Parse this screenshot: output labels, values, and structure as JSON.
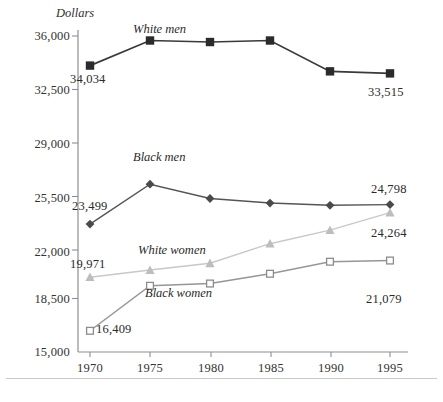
{
  "chart_data": {
    "type": "line",
    "title": "",
    "ylabel": "Dollars",
    "xlabel": "",
    "categories": [
      "1970",
      "1975",
      "1980",
      "1985",
      "1990",
      "1995"
    ],
    "x": [
      1970,
      1975,
      1980,
      1985,
      1990,
      1995
    ],
    "ylim": [
      15000,
      36000
    ],
    "yticks": [
      "15,000",
      "18,500",
      "22,000",
      "25,500",
      "29,000",
      "32,500",
      "36,000"
    ],
    "ytick_values": [
      15000,
      18500,
      22000,
      25500,
      29000,
      32500,
      36000
    ],
    "grid": false,
    "legend_position": "inline-labels",
    "series": [
      {
        "name": "White men",
        "marker": "filled-square",
        "color": "#2b2b2b",
        "line_color": "#3a3a3a",
        "values": [
          34034,
          35700,
          35600,
          35700,
          33650,
          33515
        ],
        "endpoint_labels": {
          "first": "34,034",
          "last": "33,515"
        }
      },
      {
        "name": "Black men",
        "marker": "filled-diamond",
        "color": "#4a4a4a",
        "line_color": "#555555",
        "values": [
          23499,
          26150,
          25200,
          24900,
          24750,
          24798
        ],
        "endpoint_labels": {
          "first": "23,499",
          "last": "24,798"
        }
      },
      {
        "name": "White women",
        "marker": "filled-triangle",
        "color": "#bdbdbd",
        "line_color": "#c8c8c8",
        "values": [
          19971,
          20450,
          20900,
          22200,
          23100,
          24264
        ],
        "endpoint_labels": {
          "first": "19,971",
          "last": "24,264"
        }
      },
      {
        "name": "Black women",
        "marker": "open-square",
        "color": "#8c8c8c",
        "line_color": "#969696",
        "values": [
          16409,
          19400,
          19550,
          20200,
          21000,
          21079
        ],
        "endpoint_labels": {
          "first": "16,409",
          "last": "21,079"
        }
      }
    ],
    "annotations": [
      {
        "text": "White men",
        "series": "White men"
      },
      {
        "text": "Black men",
        "series": "Black men"
      },
      {
        "text": "White women",
        "series": "White women"
      },
      {
        "text": "Black women",
        "series": "Black women"
      }
    ]
  },
  "axis": {
    "y_title": "Dollars",
    "ytick_0": "36,000",
    "ytick_1": "32,500",
    "ytick_2": "29,000",
    "ytick_3": "25,500",
    "ytick_4": "22,000",
    "ytick_5": "18,500",
    "ytick_6": "15,000",
    "xtick_0": "1970",
    "xtick_1": "1975",
    "xtick_2": "1980",
    "xtick_3": "1985",
    "xtick_4": "1990",
    "xtick_5": "1995"
  },
  "labels": {
    "white_men": "White men",
    "black_men": "Black men",
    "white_women": "White women",
    "black_women": "Black women",
    "wm_first": "34,034",
    "wm_last": "33,515",
    "bm_first": "23,499",
    "bm_last": "24,798",
    "ww_first": "19,971",
    "ww_last": "24,264",
    "bw_first": "16,409",
    "bw_last": "21,079"
  }
}
